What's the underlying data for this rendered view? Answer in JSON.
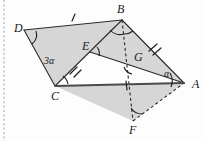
{
  "figure": {
    "canvas": {
      "width": 204,
      "height": 141
    },
    "background_color": "#fdfdfd",
    "shade_color": "#d2d2d2",
    "line_color": "#2b2b2b",
    "margin_rule_color": "#9aa7c0"
  },
  "vertices": [
    {
      "name": "D",
      "label": "D",
      "x": 24,
      "y": 30,
      "label_x": 14,
      "label_y": 32
    },
    {
      "name": "B",
      "label": "B",
      "x": 122,
      "y": 20,
      "label_x": 117,
      "label_y": 13
    },
    {
      "name": "C",
      "label": "C",
      "x": 55,
      "y": 86,
      "label_x": 51,
      "label_y": 100
    },
    {
      "name": "A",
      "label": "A",
      "x": 184,
      "y": 83,
      "label_x": 192,
      "label_y": 88
    },
    {
      "name": "E",
      "label": "E",
      "x": 90,
      "y": 52,
      "label_x": 82,
      "label_y": 50
    },
    {
      "name": "G",
      "label": "G",
      "x": 131,
      "y": 63,
      "label_x": 134,
      "label_y": 61
    },
    {
      "name": "F",
      "label": "F",
      "x": 133,
      "y": 121,
      "label_x": 129,
      "label_y": 134
    }
  ],
  "angle_labels": [
    {
      "name": "angle-3alpha",
      "text": "3α",
      "x": 47,
      "y": 63
    },
    {
      "name": "angle-alpha",
      "text": "α",
      "x": 167,
      "y": 76
    }
  ],
  "segments": [
    {
      "name": "segment-DB",
      "from": "D",
      "to": "B",
      "style": "solid",
      "ticks": 1
    },
    {
      "name": "segment-DC",
      "from": "D",
      "to": "C",
      "style": "solid",
      "ticks": 0
    },
    {
      "name": "segment-CB",
      "from": "C",
      "to": "B",
      "style": "solid",
      "ticks": 0
    },
    {
      "name": "segment-CE",
      "from": "C",
      "to": "E",
      "style": "solid",
      "ticks": 2
    },
    {
      "name": "segment-EA",
      "from": "E",
      "to": "A",
      "style": "solid",
      "ticks": 0
    },
    {
      "name": "segment-BA",
      "from": "B",
      "to": "A",
      "style": "solid",
      "ticks": 2
    },
    {
      "name": "segment-CA",
      "from": "C",
      "to": "A",
      "style": "thick",
      "ticks": 1
    },
    {
      "name": "segment-BF",
      "from": "B",
      "to": "F",
      "style": "dashed",
      "ticks": 0
    },
    {
      "name": "segment-FA",
      "from": "F",
      "to": "A",
      "style": "dashed",
      "ticks": 0
    }
  ],
  "regions": [
    {
      "name": "region-DBCE",
      "vertices": [
        "D",
        "B",
        "C"
      ]
    },
    {
      "name": "region-BEA",
      "vertices": [
        "B",
        "E",
        "A"
      ]
    },
    {
      "name": "region-CFA",
      "vertices": [
        "C",
        "F",
        "A"
      ]
    }
  ],
  "angle_arcs": [
    {
      "name": "arc-at-D",
      "vertex": "D"
    },
    {
      "name": "arc-at-C",
      "vertex": "C"
    },
    {
      "name": "arc-at-B",
      "vertex": "B"
    },
    {
      "name": "arc-at-B-lower",
      "vertex": "B"
    },
    {
      "name": "arc-at-E",
      "vertex": "E"
    },
    {
      "name": "arc-at-G",
      "vertex": "G"
    },
    {
      "name": "arc-at-A",
      "vertex": "A"
    },
    {
      "name": "arc-at-F",
      "vertex": "F"
    }
  ]
}
